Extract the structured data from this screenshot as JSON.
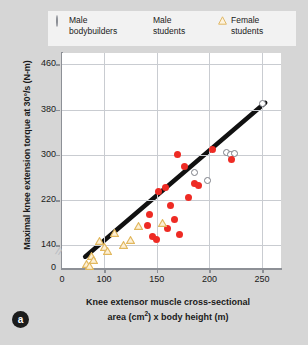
{
  "legend": {
    "entries": [
      {
        "marker": "open-circle-icon",
        "line1": "Male",
        "line2": "bodybuilders",
        "color": "#8a8d94"
      },
      {
        "marker": "red-dot-icon",
        "line1": "Male",
        "line2": "students",
        "color": "#ee2b24"
      },
      {
        "marker": "triangle-icon",
        "line1": "Female",
        "line2": "students",
        "color": "#e2b85e"
      }
    ]
  },
  "panel": {
    "label": "a"
  },
  "chart_data": {
    "type": "scatter",
    "title": "",
    "xlabel_line1": "Knee extensor muscle cross-sectional",
    "xlabel_line2_pre": "area (cm",
    "xlabel_line2_sup": "2",
    "xlabel_line2_post": ") x body height (m)",
    "ylabel": "Maximal knee extension torque at 30°/s (N-m)",
    "xlim": [
      60,
      268
    ],
    "ylim": [
      100,
      480
    ],
    "xticks": [
      0,
      100,
      150,
      200,
      250
    ],
    "yticks": [
      0,
      140,
      220,
      300,
      380,
      460
    ],
    "grid": true,
    "axis_break": true,
    "legend_position": "top",
    "regression_line": {
      "x0": 82,
      "y0": 120,
      "x1": 253,
      "y1": 392
    },
    "series": [
      {
        "name": "Male bodybuilders",
        "marker": "open-circle",
        "color": "#7b7e86",
        "points": [
          [
            186,
            268
          ],
          [
            198,
            255
          ],
          [
            216,
            305
          ],
          [
            220,
            300
          ],
          [
            224,
            302
          ],
          [
            250,
            390
          ]
        ]
      },
      {
        "name": "Male students",
        "marker": "filled-circle",
        "color": "#ee2b24",
        "points": [
          [
            141,
            175
          ],
          [
            143,
            195
          ],
          [
            146,
            155
          ],
          [
            150,
            150
          ],
          [
            152,
            235
          ],
          [
            158,
            243
          ],
          [
            160,
            170
          ],
          [
            163,
            210
          ],
          [
            167,
            185
          ],
          [
            170,
            300
          ],
          [
            172,
            160
          ],
          [
            176,
            280
          ],
          [
            180,
            225
          ],
          [
            186,
            250
          ],
          [
            190,
            245
          ],
          [
            203,
            310
          ],
          [
            221,
            292
          ]
        ]
      },
      {
        "name": "Female students",
        "marker": "triangle",
        "color": "#e2b85e",
        "points": [
          [
            83,
            118
          ],
          [
            86,
            115
          ],
          [
            88,
            132
          ],
          [
            90,
            125
          ],
          [
            96,
            158
          ],
          [
            100,
            148
          ],
          [
            103,
            140
          ],
          [
            110,
            172
          ],
          [
            118,
            152
          ],
          [
            125,
            160
          ],
          [
            133,
            185
          ],
          [
            155,
            190
          ]
        ]
      }
    ]
  }
}
